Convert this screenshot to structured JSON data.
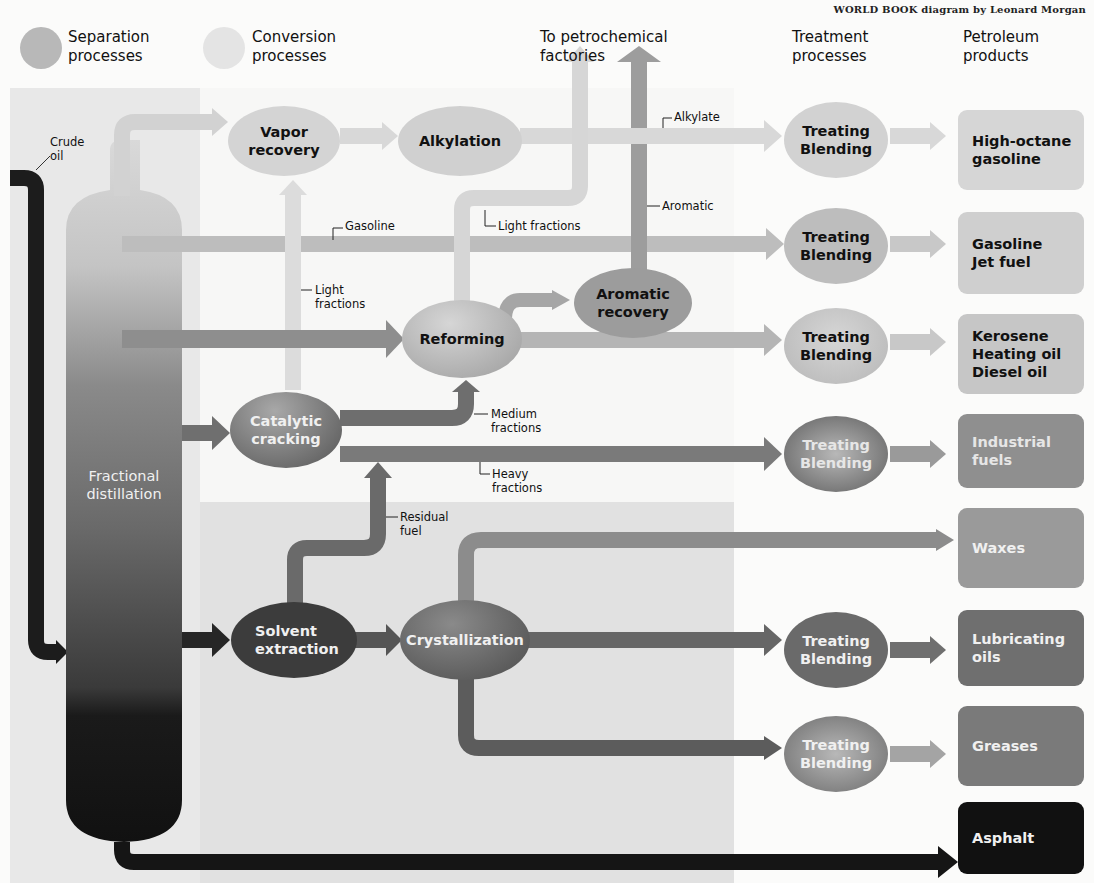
{
  "credit": "WORLD BOOK diagram by Leonard Morgan",
  "legend": [
    {
      "label": "Separation\nprocesses",
      "color": "#b5b5b5"
    },
    {
      "label": "Conversion\nprocesses",
      "color": "#e2e2e2"
    }
  ],
  "column_headers": {
    "petrochemical": "To petrochemical\nfactories",
    "treatment": "Treatment\nprocesses",
    "products": "Petroleum\nproducts"
  },
  "input": {
    "label": "Crude\noil"
  },
  "column": {
    "label": "Fractional\ndistillation"
  },
  "process_nodes": {
    "vapor_recovery": "Vapor\nrecovery",
    "alkylation": "Alkylation",
    "reforming": "Reforming",
    "aromatic_recovery": "Aromatic\nrecovery",
    "catalytic_cracking": "Catalytic\ncracking",
    "solvent_extraction": "Solvent\nextraction",
    "crystallization": "Crystallization"
  },
  "flow_labels": {
    "alkylate": "Alkylate",
    "aromatic": "Aromatic",
    "light_fractions_top": "Light fractions",
    "gasoline": "Gasoline",
    "light_fractions_left": "Light\nfractions",
    "medium_fractions": "Medium\nfractions",
    "heavy_fractions": "Heavy\nfractions",
    "residual_fuel": "Residual\nfuel"
  },
  "treatment_label": "Treating\nBlending",
  "products": [
    {
      "label": "High-octane\ngasoline",
      "color": "#d6d6d6",
      "text": "#111"
    },
    {
      "label": "Gasoline\nJet fuel",
      "color": "#cfcfcf",
      "text": "#111"
    },
    {
      "label": "Kerosene\nHeating oil\nDiesel oil",
      "color": "#c6c6c6",
      "text": "#111"
    },
    {
      "label": "Industrial\nfuels",
      "color": "#8f8f8f",
      "text": "#e6e6e6"
    },
    {
      "label": "Waxes",
      "color": "#9a9a9a",
      "text": "#f0f0f0"
    },
    {
      "label": "Lubricating\noils",
      "color": "#6f6f6f",
      "text": "#f0f0f0"
    },
    {
      "label": "Greases",
      "color": "#7a7a7a",
      "text": "#f0f0f0"
    },
    {
      "label": "Asphalt",
      "color": "#111111",
      "text": "#f0f0f0"
    }
  ]
}
